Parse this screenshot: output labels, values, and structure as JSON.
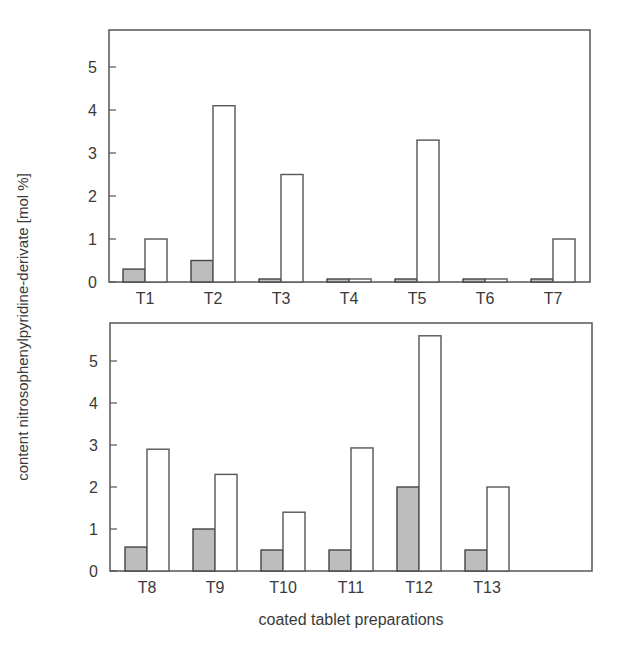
{
  "chart_data": [
    {
      "type": "bar",
      "panel": "top",
      "categories": [
        "T1",
        "T2",
        "T3",
        "T4",
        "T5",
        "T6",
        "T7"
      ],
      "series": [
        {
          "name": "grey",
          "color": "#bdbdbd",
          "values": [
            0.3,
            0.5,
            0.07,
            0.07,
            0.07,
            0.07,
            0.07
          ]
        },
        {
          "name": "white",
          "color": "#ffffff",
          "values": [
            1.0,
            4.1,
            2.5,
            0.07,
            3.3,
            0.07,
            1.0
          ]
        }
      ],
      "yticks": [
        0,
        1,
        2,
        3,
        4,
        5
      ],
      "ylim": [
        0,
        5.85
      ],
      "grid": false,
      "legend": "none"
    },
    {
      "type": "bar",
      "panel": "bottom",
      "categories": [
        "T8",
        "T9",
        "T10",
        "T11",
        "T12",
        "T13"
      ],
      "series": [
        {
          "name": "grey",
          "color": "#bdbdbd",
          "values": [
            0.57,
            1.0,
            0.5,
            0.5,
            2.0,
            0.5
          ]
        },
        {
          "name": "white",
          "color": "#ffffff",
          "values": [
            2.9,
            2.3,
            1.4,
            2.93,
            5.6,
            2.0
          ]
        }
      ],
      "yticks": [
        0,
        1,
        2,
        3,
        4,
        5
      ],
      "ylim": [
        0,
        5.85
      ],
      "grid": false,
      "legend": "none"
    }
  ],
  "labels": {
    "ylabel": "content nitrosophenylpyridine-derivate [mol %]",
    "xlabel": "coated tablet preparations"
  }
}
